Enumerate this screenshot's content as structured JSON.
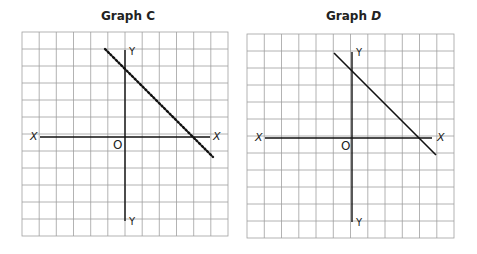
{
  "graphs": [
    {
      "id": "C",
      "title_prefix": "Graph",
      "title_var": "C",
      "line_style": "dotted",
      "labels": {
        "x_left": "X",
        "x_right": "X",
        "y_top": "Y",
        "y_bottom": "Y",
        "origin": "O"
      },
      "grid": {
        "rows": 12,
        "cols": 12
      }
    },
    {
      "id": "D",
      "title_prefix": "Graph",
      "title_var": "D",
      "line_style": "solid",
      "labels": {
        "x_left": "X",
        "x_right": "X",
        "y_top": "Y",
        "y_bottom": "Y",
        "origin": "O"
      },
      "grid": {
        "rows": 12,
        "cols": 12
      }
    }
  ],
  "colors": {
    "grid": "#9a9a9a",
    "axis": "#111111",
    "line": "#111111",
    "background": "#ffffff"
  }
}
